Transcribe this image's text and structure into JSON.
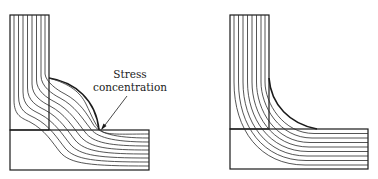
{
  "figure": {
    "panels": [
      {
        "id": "left",
        "description": "L-shaped joint with convex fillet; flow lines crowd at corner",
        "annotation": {
          "line1": "Stress",
          "line2": "concentration"
        }
      },
      {
        "id": "right",
        "description": "L-shaped joint with concave fillet; flow lines curve smoothly"
      }
    ],
    "colors": {
      "stroke": "#1a1a1a",
      "background": "#ffffff"
    }
  }
}
